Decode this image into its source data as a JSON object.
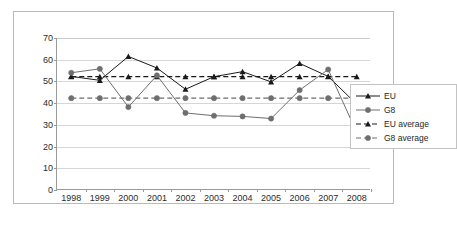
{
  "chart_data": {
    "type": "line",
    "title": "",
    "xlabel": "",
    "ylabel": "",
    "categories": [
      "1998",
      "1999",
      "2000",
      "2001",
      "2002",
      "2003",
      "2004",
      "2005",
      "2006",
      "2007",
      "2008"
    ],
    "ylim": [
      0,
      70
    ],
    "ytick_step": 10,
    "yticks": [
      "70",
      "60",
      "50",
      "40",
      "30",
      "20",
      "10",
      "0"
    ],
    "grid": true,
    "legend_position": "right",
    "series": [
      {
        "name": "EU",
        "marker": "triangle",
        "line": "solid",
        "color": "#1a1a1a",
        "values": [
          52.3,
          50.5,
          61.5,
          56.2,
          46.4,
          52.2,
          54.5,
          49.8,
          58.3,
          52.3,
          39.5
        ]
      },
      {
        "name": "G8",
        "marker": "circle",
        "line": "solid",
        "color": "#6e6e6e",
        "values": [
          54.0,
          55.8,
          38.2,
          52.8,
          35.5,
          34.2,
          33.9,
          32.9,
          46.0,
          55.5,
          26.5
        ]
      },
      {
        "name": "EU average",
        "marker": "triangle",
        "line": "dashed",
        "color": "#1a1a1a",
        "values": [
          52.2,
          52.2,
          52.2,
          52.2,
          52.2,
          52.2,
          52.2,
          52.2,
          52.2,
          52.2,
          52.2
        ]
      },
      {
        "name": "G8 average",
        "marker": "circle",
        "line": "dashed",
        "color": "#6e6e6e",
        "values": [
          42.3,
          42.3,
          42.3,
          42.3,
          42.3,
          42.3,
          42.3,
          42.3,
          42.3,
          42.3,
          42.3
        ]
      }
    ]
  },
  "legend": {
    "items": [
      {
        "label": "EU"
      },
      {
        "label": "G8"
      },
      {
        "label": "EU average"
      },
      {
        "label": "G8 average"
      }
    ]
  },
  "colors": {
    "eu": "#1a1a1a",
    "g8": "#6e6e6e",
    "grid": "#d6d6d6",
    "axis": "#9a9a9a",
    "frame": "#b9b9b9",
    "background": "#ffffff"
  }
}
